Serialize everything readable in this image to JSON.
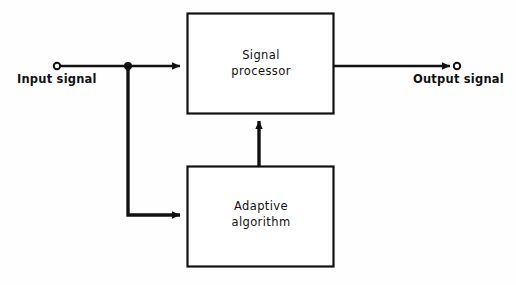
{
  "diagram": {
    "background_color": "#fefefe",
    "line_color": "#111111",
    "blocks": [
      {
        "id": "signal-processor",
        "label_line1": "Signal",
        "label_line2": "processor",
        "x": 187,
        "y": 13,
        "width": 147,
        "height": 101,
        "fill": "#ffffff",
        "stroke": "#111111"
      },
      {
        "id": "adaptive-algorithm",
        "label_line1": "Adaptive",
        "label_line2": "algorithm",
        "x": 187,
        "y": 166,
        "width": 147,
        "height": 101,
        "fill": "#ffffff",
        "stroke": "#111111"
      }
    ],
    "terminals": [
      {
        "id": "input-terminal",
        "label": "Input signal",
        "cx": 57,
        "cy": 66,
        "r": 3.2
      },
      {
        "id": "output-terminal",
        "label": "Output signal",
        "cx": 457,
        "cy": 66,
        "r": 3.2
      }
    ],
    "junction": {
      "id": "input-branch-junction",
      "cx": 128,
      "cy": 66,
      "r": 4.0
    },
    "connections": [
      {
        "id": "input-to-processor",
        "from": "input-terminal",
        "to": "signal-processor",
        "arrow": true
      },
      {
        "id": "processor-to-output",
        "from": "signal-processor",
        "to": "output-terminal",
        "arrow": true
      },
      {
        "id": "input-branch-to-algorithm",
        "from": "input-branch-junction",
        "to": "adaptive-algorithm",
        "arrow": true
      },
      {
        "id": "algorithm-to-processor",
        "from": "adaptive-algorithm",
        "to": "signal-processor",
        "arrow": true
      }
    ]
  }
}
